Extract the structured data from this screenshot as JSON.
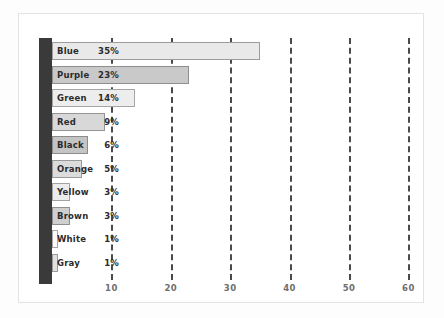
{
  "chart_data": {
    "type": "bar",
    "orientation": "horizontal",
    "title": "",
    "subtitle": "",
    "xlabel": "",
    "ylabel": "",
    "xlim": [
      0,
      62
    ],
    "ylim": null,
    "grid": true,
    "grid_axis": "x",
    "grid_style": "dashed",
    "legend": null,
    "legend_position": "none",
    "value_unit": "%",
    "categories": [
      "Blue",
      "Purple",
      "Green",
      "Red",
      "Black",
      "Orange",
      "Yellow",
      "Brown",
      "White",
      "Gray"
    ],
    "values": [
      35,
      23,
      14,
      9,
      6,
      5,
      3,
      3,
      1,
      1
    ],
    "data_labels": [
      "35%",
      "23%",
      "14%",
      "9%",
      "6%",
      "5%",
      "3%",
      "3%",
      "1%",
      "1%"
    ],
    "bars": [
      {
        "label": "Blue",
        "value": 35,
        "data_label": "35%",
        "fill": "#e9e9e9",
        "stroke": "#9d9d9d"
      },
      {
        "label": "Purple",
        "value": 23,
        "data_label": "23%",
        "fill": "#c9c9c9",
        "stroke": "#8e8e8e"
      },
      {
        "label": "Green",
        "value": 14,
        "data_label": "14%",
        "fill": "#ededed",
        "stroke": "#a5a5a5"
      },
      {
        "label": "Red",
        "value": 9,
        "data_label": "9%",
        "fill": "#d8d8d8",
        "stroke": "#949494"
      },
      {
        "label": "Black",
        "value": 6,
        "data_label": "6%",
        "fill": "#c4c4c4",
        "stroke": "#8c8c8c"
      },
      {
        "label": "Orange",
        "value": 5,
        "data_label": "5%",
        "fill": "#dcdcdc",
        "stroke": "#9a9a9a"
      },
      {
        "label": "Yellow",
        "value": 3,
        "data_label": "3%",
        "fill": "#ececec",
        "stroke": "#a2a2a2"
      },
      {
        "label": "Brown",
        "value": 3,
        "data_label": "3%",
        "fill": "#cfcfcf",
        "stroke": "#909090"
      },
      {
        "label": "White",
        "value": 1,
        "data_label": "1%",
        "fill": "#fbfbfb",
        "stroke": "#a8a8a8"
      },
      {
        "label": "Gray",
        "value": 1,
        "data_label": "1%",
        "fill": "#e0e0e0",
        "stroke": "#9a9a9a"
      }
    ],
    "x_ticks": [
      10,
      20,
      30,
      40,
      50,
      60
    ],
    "x_tick_labels": [
      "10",
      "20",
      "30",
      "40",
      "50",
      "60"
    ]
  },
  "colors": {
    "figure_background": "#fdfdfd",
    "plot_background": "#ffffff",
    "frame_border": "#e3e3e3",
    "axis_spine": "#3a3a3a",
    "gridline": "#4a4a4a",
    "tick_text": "#6e6e6e",
    "label_text": "#2b2b2b"
  }
}
